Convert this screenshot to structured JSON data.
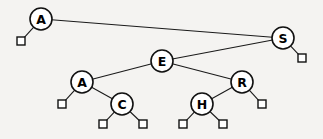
{
  "diagram": {
    "type": "tree",
    "background_color": "#f4f3f1",
    "node_fill": "#ffffff",
    "node_stroke": "#111111",
    "edge_color": "#1a1a1a",
    "label_color": "#000000",
    "node_radius": 11,
    "leaf_size": 8,
    "nodes": [
      {
        "id": "n0",
        "label": "A",
        "x": 41,
        "y": 19,
        "level": 0
      },
      {
        "id": "n1",
        "label": "S",
        "x": 283,
        "y": 38,
        "level": 1
      },
      {
        "id": "n2",
        "label": "E",
        "x": 162,
        "y": 61,
        "level": 2
      },
      {
        "id": "n3",
        "label": "A",
        "x": 82,
        "y": 82,
        "level": 3
      },
      {
        "id": "n4",
        "label": "R",
        "x": 242,
        "y": 82,
        "level": 3
      },
      {
        "id": "n5",
        "label": "C",
        "x": 122,
        "y": 104,
        "level": 4
      },
      {
        "id": "n6",
        "label": "H",
        "x": 202,
        "y": 104,
        "level": 4
      }
    ],
    "leaves": [
      {
        "id": "l0",
        "parent": "n0",
        "x": 21,
        "y": 41
      },
      {
        "id": "l1",
        "parent": "n1",
        "x": 302,
        "y": 58
      },
      {
        "id": "l2",
        "parent": "n3",
        "x": 62,
        "y": 104
      },
      {
        "id": "l3",
        "parent": "n4",
        "x": 262,
        "y": 104
      },
      {
        "id": "l4",
        "parent": "n5",
        "x": 103,
        "y": 124
      },
      {
        "id": "l5",
        "parent": "n5",
        "x": 143,
        "y": 124
      },
      {
        "id": "l6",
        "parent": "n6",
        "x": 183,
        "y": 124
      },
      {
        "id": "l7",
        "parent": "n6",
        "x": 223,
        "y": 124
      }
    ],
    "edges": [
      {
        "from": "n0",
        "to": "n1",
        "label": "A-S"
      },
      {
        "from": "n0",
        "to": "l0",
        "label": "A-null-left"
      },
      {
        "from": "n1",
        "to": "n2",
        "label": "S-E"
      },
      {
        "from": "n1",
        "to": "l1",
        "label": "S-null-right"
      },
      {
        "from": "n2",
        "to": "n3",
        "label": "E-A"
      },
      {
        "from": "n2",
        "to": "n4",
        "label": "E-R"
      },
      {
        "from": "n3",
        "to": "l2",
        "label": "A-null-left"
      },
      {
        "from": "n3",
        "to": "n5",
        "label": "A-C"
      },
      {
        "from": "n4",
        "to": "n6",
        "label": "R-H"
      },
      {
        "from": "n4",
        "to": "l3",
        "label": "R-null-right"
      },
      {
        "from": "n5",
        "to": "l4",
        "label": "C-null-left"
      },
      {
        "from": "n5",
        "to": "l5",
        "label": "C-null-right"
      },
      {
        "from": "n6",
        "to": "l6",
        "label": "H-null-left"
      },
      {
        "from": "n6",
        "to": "l7",
        "label": "H-null-right"
      }
    ]
  }
}
